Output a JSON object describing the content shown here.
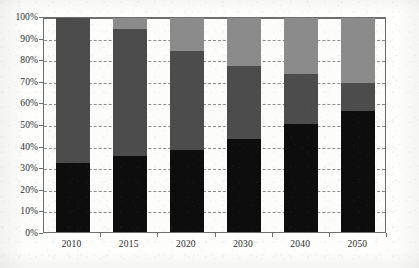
{
  "chart_data": {
    "type": "bar",
    "subtype": "stacked-100-percent",
    "title": "",
    "subtitle": "",
    "xlabel": "",
    "ylabel": "",
    "categories": [
      "2010",
      "2015",
      "2020",
      "2030",
      "2040",
      "2050"
    ],
    "ylim": [
      0,
      100
    ],
    "yticks": [
      "0%",
      "10%",
      "20%",
      "30%",
      "40%",
      "50%",
      "60%",
      "70%",
      "80%",
      "90%",
      "100%"
    ],
    "ytick_values": [
      0,
      10,
      20,
      30,
      40,
      50,
      60,
      70,
      80,
      90,
      100
    ],
    "grid": true,
    "grid_style": "dashed",
    "legend": "none",
    "series": [
      {
        "name": "series-1-black",
        "color": "#0d0d0d",
        "values": [
          32,
          35,
          38,
          43,
          50,
          56
        ]
      },
      {
        "name": "series-2-dark-gray",
        "color": "#4c4c4c",
        "values": [
          68,
          59,
          46,
          34,
          23,
          13
        ]
      },
      {
        "name": "series-3-light-gray",
        "color": "#8b8b8b",
        "values": [
          0,
          6,
          16,
          23,
          27,
          31
        ]
      }
    ]
  },
  "colors": {
    "series_1": "#0d0d0d",
    "series_2": "#4c4c4c",
    "series_3": "#8b8b8b",
    "axis": "#6e6e6e",
    "gridline": "#8d8d8d",
    "text": "#2a2a2a",
    "background": "#fdfdfc"
  }
}
